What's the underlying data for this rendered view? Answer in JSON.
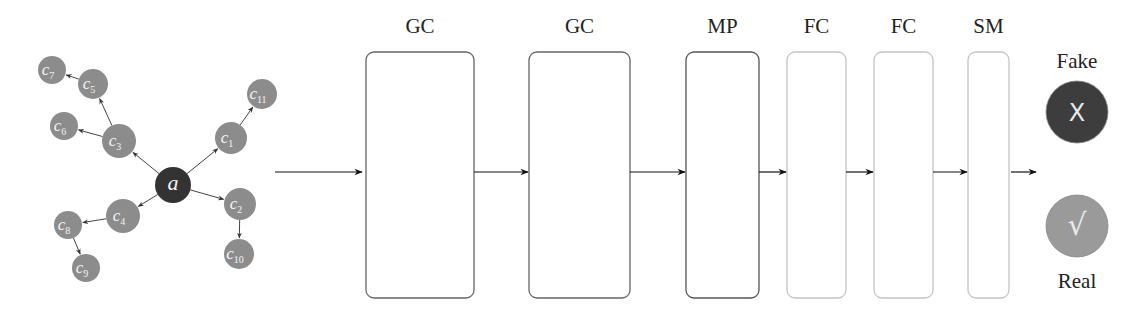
{
  "graph": {
    "center": {
      "id": "a",
      "label": "a",
      "x": 173,
      "y": 185,
      "r": 18,
      "color": "#333333"
    },
    "node_color": "#8c8c8c",
    "nodes": [
      {
        "id": "c1",
        "label": "c",
        "sub": "1",
        "x": 231,
        "y": 138,
        "r": 16
      },
      {
        "id": "c2",
        "label": "c",
        "sub": "2",
        "x": 240,
        "y": 204,
        "r": 16
      },
      {
        "id": "c3",
        "label": "c",
        "sub": "3",
        "x": 119,
        "y": 141,
        "r": 17
      },
      {
        "id": "c4",
        "label": "c",
        "sub": "4",
        "x": 123,
        "y": 216,
        "r": 17
      },
      {
        "id": "c5",
        "label": "c",
        "sub": "5",
        "x": 93,
        "y": 84,
        "r": 15
      },
      {
        "id": "c6",
        "label": "c",
        "sub": "6",
        "x": 64,
        "y": 126,
        "r": 14
      },
      {
        "id": "c7",
        "label": "c",
        "sub": "7",
        "x": 52,
        "y": 70,
        "r": 14
      },
      {
        "id": "c8",
        "label": "c",
        "sub": "8",
        "x": 68,
        "y": 225,
        "r": 14
      },
      {
        "id": "c9",
        "label": "c",
        "sub": "9",
        "x": 86,
        "y": 268,
        "r": 14
      },
      {
        "id": "c10",
        "label": "c",
        "sub": "10",
        "x": 239,
        "y": 254,
        "r": 15
      },
      {
        "id": "c11",
        "label": "c",
        "sub": "11",
        "x": 262,
        "y": 94,
        "r": 15
      }
    ],
    "edges": [
      [
        "a",
        "c1"
      ],
      [
        "a",
        "c2"
      ],
      [
        "a",
        "c3"
      ],
      [
        "a",
        "c4"
      ],
      [
        "c3",
        "c5"
      ],
      [
        "c3",
        "c6"
      ],
      [
        "c5",
        "c7"
      ],
      [
        "c4",
        "c8"
      ],
      [
        "c8",
        "c9"
      ],
      [
        "c2",
        "c10"
      ],
      [
        "c1",
        "c11"
      ]
    ]
  },
  "pipeline": {
    "arrow_y": 172,
    "input_arrow": {
      "x1": 275,
      "x2": 362
    },
    "layers": [
      {
        "label": "GC",
        "x": 366,
        "y": 52,
        "w": 108,
        "h": 246,
        "stroke": "#666666"
      },
      {
        "label": "GC",
        "x": 529,
        "y": 52,
        "w": 101,
        "h": 246,
        "stroke": "#666666"
      },
      {
        "label": "MP",
        "x": 686,
        "y": 52,
        "w": 73,
        "h": 246,
        "stroke": "#555555"
      },
      {
        "label": "FC",
        "x": 787,
        "y": 52,
        "w": 59,
        "h": 246,
        "stroke": "#c4c4c4"
      },
      {
        "label": "FC",
        "x": 874,
        "y": 52,
        "w": 59,
        "h": 246,
        "stroke": "#c4c4c4"
      },
      {
        "label": "SM",
        "x": 968,
        "y": 52,
        "w": 41,
        "h": 246,
        "stroke": "#c4c4c4"
      }
    ],
    "output_arrow": {
      "x1": 1011,
      "x2": 1036
    }
  },
  "outputs": [
    {
      "label": "Fake",
      "symbol": "X",
      "x": 1077,
      "y": 112,
      "r": 31,
      "fill": "#3d3d3d",
      "label_y": 68
    },
    {
      "label": "Real",
      "symbol": "√",
      "x": 1077,
      "y": 226,
      "r": 31,
      "fill": "#9a9a9a",
      "label_y": 288
    }
  ]
}
